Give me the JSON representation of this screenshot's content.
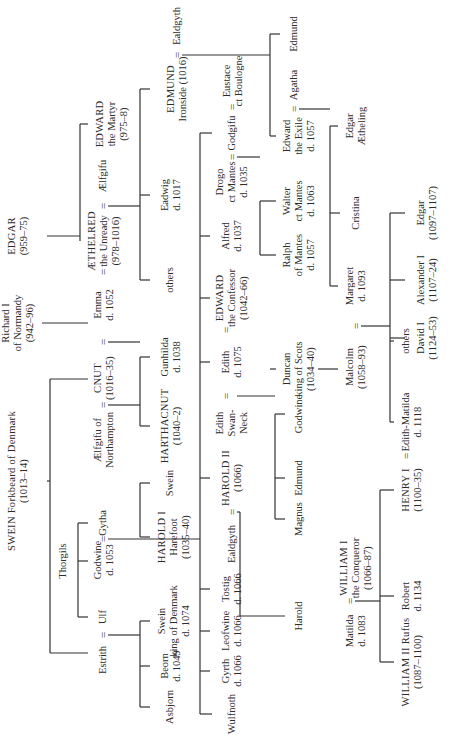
{
  "nodes": [
    {
      "id": "edgar",
      "lines": [
        "EDGAR",
        "(959–75)"
      ],
      "u": 505,
      "v": 6
    },
    {
      "id": "richard",
      "lines": [
        "Richard I",
        "of Normandy",
        "(942–96)"
      ],
      "u": 418,
      "v": 0
    },
    {
      "id": "swein",
      "lines": [
        "SWEIN Forkbeard of Denmark",
        "(1013–14)"
      ],
      "u": 260,
      "v": 6
    },
    {
      "id": "edward_martyr",
      "lines": [
        "EDWARD",
        "the Martyr",
        "(975–8)"
      ],
      "u": 617,
      "v": 94
    },
    {
      "id": "aelfgifu",
      "lines": [
        "Ælfgifu"
      ],
      "u": 565,
      "v": 97
    },
    {
      "id": "aethelred",
      "lines": [
        "ÆTHELRED",
        "the Unready",
        "(978–1016)"
      ],
      "u": 500,
      "v": 86
    },
    {
      "id": "emma",
      "lines": [
        "Emma",
        "d. 1052"
      ],
      "u": 436,
      "v": 92
    },
    {
      "id": "cnut",
      "lines": [
        "CNUT",
        "(1016–35)"
      ],
      "u": 363,
      "v": 92
    },
    {
      "id": "aelfgifu_n",
      "lines": [
        "Ælfgifu of",
        "Northampton"
      ],
      "u": 301,
      "v": 92
    },
    {
      "id": "gytha",
      "lines": [
        "Gytha"
      ],
      "u": 218,
      "v": 97
    },
    {
      "id": "godwine",
      "lines": [
        "Godwine",
        "d. 1053"
      ],
      "u": 181,
      "v": 92
    },
    {
      "id": "thorgils",
      "lines": [
        "Thorgils"
      ],
      "u": 180,
      "v": 57
    },
    {
      "id": "ulf",
      "lines": [
        "Ulf"
      ],
      "u": 124,
      "v": 97
    },
    {
      "id": "estrith",
      "lines": [
        "Estrith"
      ],
      "u": 81,
      "v": 97
    },
    {
      "id": "ealdgyth_a",
      "lines": [
        "Ealdgyth"
      ],
      "u": 715,
      "v": 171
    },
    {
      "id": "edmund_ironside",
      "lines": [
        "EDMUND",
        "Ironside (1016)"
      ],
      "u": 652,
      "v": 165
    },
    {
      "id": "eadwig",
      "lines": [
        "Eadwig",
        "d. 1017"
      ],
      "u": 546,
      "v": 159
    },
    {
      "id": "others_a",
      "lines": [
        "others"
      ],
      "u": 461,
      "v": 164
    },
    {
      "id": "gunhilda",
      "lines": [
        "Gunhilda",
        "d. 1038"
      ],
      "u": 384,
      "v": 159
    },
    {
      "id": "harthacnut",
      "lines": [
        "HARTHACNUT",
        "(1040–2)"
      ],
      "u": 315,
      "v": 159
    },
    {
      "id": "swein_s",
      "lines": [
        "Swein"
      ],
      "u": 258,
      "v": 164
    },
    {
      "id": "harold_i",
      "lines": [
        "HAROLD I",
        "Harefoot",
        "(1035–40)"
      ],
      "u": 204,
      "v": 156
    },
    {
      "id": "swein_k",
      "lines": [
        "Swein",
        "king of Denmark",
        "d. 1074"
      ],
      "u": 120,
      "v": 156
    },
    {
      "id": "beorn",
      "lines": [
        "Beorn",
        "d. 1049"
      ],
      "u": 75,
      "v": 159
    },
    {
      "id": "asbjorn",
      "lines": [
        "Asbjorn"
      ],
      "u": 34,
      "v": 164
    },
    {
      "id": "eustace",
      "lines": [
        "Eustace",
        "ct Boulogne"
      ],
      "u": 660,
      "v": 221
    },
    {
      "id": "godgifu",
      "lines": [
        "Godgifu"
      ],
      "u": 608,
      "v": 226
    },
    {
      "id": "drogo",
      "lines": [
        "Drogo",
        "ct Mantes",
        "d. 1035"
      ],
      "u": 559,
      "v": 214
    },
    {
      "id": "alfred",
      "lines": [
        "Alfred",
        "d. 1037"
      ],
      "u": 505,
      "v": 220
    },
    {
      "id": "edward_confessor",
      "lines": [
        "EDWARD",
        "the Confessor",
        "(1042–66)"
      ],
      "u": 443,
      "v": 214
    },
    {
      "id": "edith_g",
      "lines": [
        "Edith",
        "d. 1075"
      ],
      "u": 379,
      "v": 220
    },
    {
      "id": "edith_sn",
      "lines": [
        "Edith",
        "Swan-",
        "Neck"
      ],
      "u": 318,
      "v": 214
    },
    {
      "id": "harold_ii",
      "lines": [
        "HAROLD II",
        "(1066)"
      ],
      "u": 263,
      "v": 220
    },
    {
      "id": "ealdgyth_b",
      "lines": [
        "Ealdgyth"
      ],
      "u": 197,
      "v": 226
    },
    {
      "id": "tostig",
      "lines": [
        "Tostig",
        "d. 1066"
      ],
      "u": 152,
      "v": 220
    },
    {
      "id": "leofwine",
      "lines": [
        "Leofwine",
        "d. 1066"
      ],
      "u": 110,
      "v": 220
    },
    {
      "id": "gyrth",
      "lines": [
        "Gyrth",
        "d. 1066"
      ],
      "u": 70,
      "v": 220
    },
    {
      "id": "wulfnoth",
      "lines": [
        "Wulfnoth"
      ],
      "u": 27,
      "v": 226
    },
    {
      "id": "edmund_a",
      "lines": [
        "Edmund"
      ],
      "u": 707,
      "v": 288
    },
    {
      "id": "agatha",
      "lines": [
        "Agatha"
      ],
      "u": 656,
      "v": 288
    },
    {
      "id": "edward_exile",
      "lines": [
        "Edward",
        "the Exile",
        "d. 1057"
      ],
      "u": 605,
      "v": 281
    },
    {
      "id": "walter",
      "lines": [
        "Walter",
        "ct Mantes",
        "d. 1063"
      ],
      "u": 540,
      "v": 281
    },
    {
      "id": "ralph",
      "lines": [
        "Ralph",
        "of Mantes",
        "d. 1057"
      ],
      "u": 486,
      "v": 281
    },
    {
      "id": "duncan",
      "lines": [
        "Duncan",
        "king of Scots",
        "(1034–40)"
      ],
      "u": 372,
      "v": 281
    },
    {
      "id": "godwine_s",
      "lines": [
        "Godwine"
      ],
      "u": 327,
      "v": 293
    },
    {
      "id": "edmund_s",
      "lines": [
        "Edmund"
      ],
      "u": 263,
      "v": 293
    },
    {
      "id": "magnus",
      "lines": [
        "Magnus"
      ],
      "u": 222,
      "v": 293
    },
    {
      "id": "harold_s",
      "lines": [
        "Harold"
      ],
      "u": 125,
      "v": 293
    },
    {
      "id": "edgar_aetheling",
      "lines": [
        "Edgar",
        "Ætheling"
      ],
      "u": 615,
      "v": 344
    },
    {
      "id": "cristina",
      "lines": [
        "Cristina"
      ],
      "u": 528,
      "v": 350
    },
    {
      "id": "margaret",
      "lines": [
        "Margaret",
        "d. 1093"
      ],
      "u": 455,
      "v": 344
    },
    {
      "id": "malcolm",
      "lines": [
        "Malcolm",
        "(1058–93)"
      ],
      "u": 374,
      "v": 344
    },
    {
      "id": "william_i",
      "lines": [
        "WILLIAM I",
        "the Conqueror",
        "(1066–87)"
      ],
      "u": 173,
      "v": 338
    },
    {
      "id": "matilda",
      "lines": [
        "Matilda",
        "d. 1083"
      ],
      "u": 110,
      "v": 344
    },
    {
      "id": "others_b",
      "lines": [
        "others"
      ],
      "u": 400,
      "v": 400
    },
    {
      "id": "edith_matilda",
      "lines": [
        "Edith-Matilda",
        "d. 1118"
      ],
      "u": 319,
      "v": 400
    },
    {
      "id": "henry_i",
      "lines": [
        "HENRY I",
        "(1100–35)"
      ],
      "u": 251,
      "v": 400
    },
    {
      "id": "robert",
      "lines": [
        "Robert",
        "d. 1134"
      ],
      "u": 145,
      "v": 400
    },
    {
      "id": "william_ii",
      "lines": [
        "WILLIAM II Rufus",
        "(1087–1100)"
      ],
      "u": 79,
      "v": 400
    },
    {
      "id": "edgar_k",
      "lines": [
        "Edgar",
        "(1097–1107)"
      ],
      "u": 528,
      "v": 415
    },
    {
      "id": "alexander",
      "lines": [
        "Alexander I",
        "(1107–24)"
      ],
      "u": 461,
      "v": 415
    },
    {
      "id": "david",
      "lines": [
        "David I",
        "(1124–53)"
      ],
      "u": 403,
      "v": 415
    }
  ],
  "marriage_signs": [
    {
      "symbol": "=",
      "u": 535,
      "v": 97
    },
    {
      "symbol": "=",
      "u": 469,
      "v": 97
    },
    {
      "symbol": "=",
      "u": 399,
      "v": 97
    },
    {
      "symbol": "=",
      "u": 336,
      "v": 97
    },
    {
      "symbol": "=",
      "u": 202,
      "v": 97
    },
    {
      "symbol": "=",
      "u": 106,
      "v": 97
    },
    {
      "symbol": "=",
      "u": 686,
      "v": 171
    },
    {
      "symbol": "=",
      "u": 634,
      "v": 226
    },
    {
      "symbol": "=",
      "u": 584,
      "v": 226
    },
    {
      "symbol": "=",
      "u": 411,
      "v": 220
    },
    {
      "symbol": "=",
      "u": 345,
      "v": 220
    },
    {
      "symbol": "=",
      "u": 229,
      "v": 226
    },
    {
      "symbol": "=",
      "u": 632,
      "v": 288
    },
    {
      "symbol": "=",
      "u": 415,
      "v": 350
    },
    {
      "symbol": "=",
      "u": 140,
      "v": 344
    },
    {
      "symbol": "=",
      "u": 285,
      "v": 400
    }
  ],
  "lines": [
    [
      505,
      47,
      505,
      80
    ],
    [
      505,
      80,
      617,
      80
    ],
    [
      617,
      80,
      617,
      88
    ],
    [
      505,
      80,
      500,
      80
    ],
    [
      418,
      42,
      418,
      88
    ],
    [
      260,
      47,
      260,
      50
    ],
    [
      260,
      50,
      362,
      50
    ],
    [
      362,
      50,
      362,
      88
    ],
    [
      260,
      50,
      88,
      50
    ],
    [
      88,
      50,
      88,
      88
    ],
    [
      180,
      78,
      180,
      88
    ],
    [
      218,
      78,
      124,
      78
    ],
    [
      218,
      78,
      218,
      88
    ],
    [
      124,
      78,
      124,
      88
    ],
    [
      535,
      108,
      535,
      140
    ],
    [
      652,
      140,
      461,
      140
    ],
    [
      652,
      140,
      652,
      150
    ],
    [
      546,
      140,
      546,
      150
    ],
    [
      461,
      140,
      461,
      150
    ],
    [
      399,
      108,
      399,
      140
    ],
    [
      315,
      140,
      384,
      140
    ],
    [
      384,
      140,
      384,
      150
    ],
    [
      315,
      140,
      315,
      150
    ],
    [
      336,
      108,
      336,
      140
    ],
    [
      258,
      140,
      204,
      140
    ],
    [
      258,
      140,
      258,
      150
    ],
    [
      204,
      140,
      204,
      150
    ],
    [
      106,
      108,
      106,
      140
    ],
    [
      120,
      140,
      34,
      140
    ],
    [
      120,
      140,
      120,
      150
    ],
    [
      75,
      140,
      75,
      150
    ],
    [
      34,
      140,
      34,
      150
    ],
    [
      202,
      108,
      202,
      200
    ],
    [
      608,
      200,
      27,
      200
    ],
    [
      608,
      200,
      608,
      212
    ],
    [
      505,
      200,
      505,
      210
    ],
    [
      443,
      200,
      443,
      210
    ],
    [
      379,
      200,
      379,
      210
    ],
    [
      263,
      200,
      263,
      210
    ],
    [
      152,
      200,
      152,
      210
    ],
    [
      110,
      200,
      110,
      210
    ],
    [
      70,
      200,
      70,
      210
    ],
    [
      27,
      200,
      27,
      212
    ],
    [
      686,
      182,
      686,
      270
    ],
    [
      707,
      270,
      605,
      270
    ],
    [
      707,
      270,
      707,
      280
    ],
    [
      605,
      270,
      605,
      276
    ],
    [
      584,
      237,
      584,
      260
    ],
    [
      540,
      260,
      486,
      260
    ],
    [
      540,
      260,
      540,
      276
    ],
    [
      486,
      260,
      486,
      276
    ],
    [
      345,
      237,
      345,
      275
    ],
    [
      372,
      270,
      372,
      276
    ],
    [
      327,
      275,
      222,
      275
    ],
    [
      327,
      275,
      327,
      285
    ],
    [
      263,
      275,
      263,
      285
    ],
    [
      222,
      275,
      222,
      285
    ],
    [
      229,
      237,
      229,
      240
    ],
    [
      229,
      240,
      125,
      240
    ],
    [
      125,
      240,
      125,
      285
    ],
    [
      632,
      299,
      632,
      330
    ],
    [
      615,
      330,
      455,
      330
    ],
    [
      615,
      330,
      615,
      338
    ],
    [
      528,
      330,
      528,
      340
    ],
    [
      455,
      330,
      455,
      338
    ],
    [
      372,
      318,
      372,
      338
    ],
    [
      415,
      361,
      415,
      390
    ],
    [
      528,
      390,
      319,
      390
    ],
    [
      528,
      390,
      528,
      405
    ],
    [
      461,
      390,
      461,
      405
    ],
    [
      403,
      390,
      403,
      405
    ],
    [
      400,
      390,
      400,
      394
    ],
    [
      319,
      390,
      319,
      394
    ],
    [
      140,
      355,
      140,
      380
    ],
    [
      251,
      380,
      79,
      380
    ],
    [
      251,
      380,
      251,
      394
    ],
    [
      145,
      380,
      145,
      394
    ],
    [
      79,
      380,
      79,
      394
    ]
  ]
}
